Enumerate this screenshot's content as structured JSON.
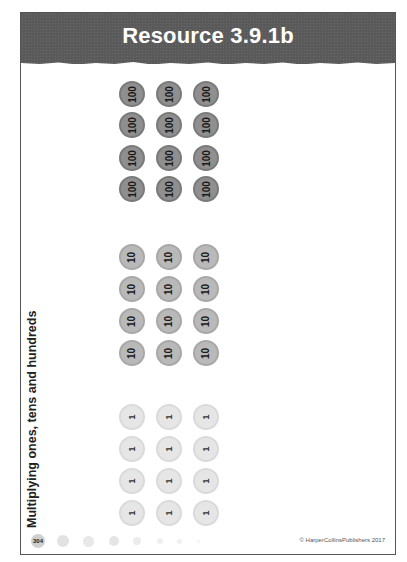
{
  "header": {
    "title": "Resource 3.9.1b",
    "background_color": "#5a5a5a"
  },
  "side_label": "Multiplying ones, tens and hundreds",
  "coins": {
    "hundreds": {
      "value": "100",
      "rows": 4,
      "columns": 3,
      "color": "#8f8f8f",
      "labels": [
        "100",
        "100",
        "100",
        "100",
        "100",
        "100",
        "100",
        "100",
        "100",
        "100",
        "100",
        "100"
      ]
    },
    "tens": {
      "value": "10",
      "rows": 4,
      "columns": 3,
      "color": "#b9b9b9",
      "labels": [
        "10",
        "10",
        "10",
        "10",
        "10",
        "10",
        "10",
        "10",
        "10",
        "10",
        "10",
        "10"
      ]
    },
    "ones": {
      "value": "1",
      "rows": 4,
      "columns": 3,
      "color": "#e6e6e6",
      "labels": [
        "1",
        "1",
        "1",
        "1",
        "1",
        "1",
        "1",
        "1",
        "1",
        "1",
        "1",
        "1"
      ]
    }
  },
  "footer": {
    "page_number": "304",
    "copyright": "© HarperCollinsPublishers 2017"
  }
}
